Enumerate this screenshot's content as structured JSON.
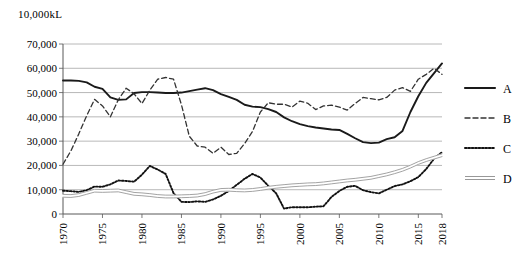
{
  "chart_data": {
    "type": "line",
    "title": "",
    "unit_label": "10,000kL",
    "xlabel": "",
    "ylabel": "",
    "xlim": [
      1970,
      2018
    ],
    "ylim": [
      0,
      70000
    ],
    "ytick_values": [
      0,
      10000,
      20000,
      30000,
      40000,
      50000,
      60000,
      70000
    ],
    "ytick_labels": [
      "0",
      "10,000",
      "20,000",
      "30,000",
      "40,000",
      "50,000",
      "60,000",
      "70,000"
    ],
    "xtick_values": [
      1970,
      1975,
      1980,
      1985,
      1990,
      1995,
      2000,
      2005,
      2010,
      2015,
      2018
    ],
    "xtick_labels": [
      "1970",
      "1975",
      "1980",
      "1985",
      "1990",
      "1995",
      "2000",
      "2005",
      "2010",
      "2015",
      "2018"
    ],
    "grid": "horizontal",
    "legend_position": "right",
    "x": [
      1970,
      1971,
      1972,
      1973,
      1974,
      1975,
      1976,
      1977,
      1978,
      1979,
      1980,
      1981,
      1982,
      1983,
      1984,
      1985,
      1986,
      1987,
      1988,
      1989,
      1990,
      1991,
      1992,
      1993,
      1994,
      1995,
      1996,
      1997,
      1998,
      1999,
      2000,
      2001,
      2002,
      2003,
      2004,
      2005,
      2006,
      2007,
      2008,
      2009,
      2010,
      2011,
      2012,
      2013,
      2014,
      2015,
      2016,
      2017,
      2018
    ],
    "series": [
      {
        "name": "A",
        "style": "solid",
        "color": "#1a1a1a",
        "values": [
          55000,
          55000,
          54800,
          54200,
          52400,
          51500,
          48000,
          47000,
          47200,
          49800,
          50200,
          50200,
          50000,
          49800,
          49800,
          50000,
          50600,
          51200,
          51800,
          51000,
          49400,
          48200,
          47000,
          45000,
          44200,
          44000,
          43200,
          42000,
          39800,
          38200,
          37000,
          36200,
          35600,
          35200,
          34800,
          34600,
          33000,
          31200,
          29600,
          29200,
          29400,
          30800,
          31600,
          34200,
          42000,
          48500,
          54000,
          58000,
          62000
        ]
      },
      {
        "name": "B",
        "style": "dashed",
        "color": "#333333",
        "values": [
          20500,
          26000,
          33000,
          40500,
          47200,
          44500,
          40000,
          47000,
          51800,
          49500,
          45500,
          51000,
          55500,
          56200,
          55500,
          45000,
          32000,
          28000,
          27500,
          25000,
          27500,
          24500,
          25000,
          29000,
          34000,
          42000,
          45800,
          45200,
          45200,
          44000,
          46500,
          45600,
          43000,
          44500,
          44800,
          44000,
          42800,
          45500,
          48000,
          47500,
          47000,
          48000,
          51000,
          52000,
          50500,
          55500,
          57500,
          60000,
          57500
        ]
      },
      {
        "name": "C",
        "style": "dotted",
        "color": "#111111",
        "values": [
          9600,
          9400,
          9100,
          9800,
          11300,
          11200,
          12200,
          13800,
          13600,
          13300,
          16200,
          19800,
          18300,
          16500,
          8600,
          5000,
          4900,
          5200,
          5000,
          6000,
          7500,
          9500,
          12000,
          14500,
          16500,
          15000,
          11600,
          8500,
          2200,
          2800,
          2800,
          2800,
          3000,
          3200,
          7000,
          9500,
          11200,
          11600,
          9800,
          9000,
          8500,
          10000,
          11500,
          12200,
          13500,
          15200,
          18500,
          22800,
          25500
        ]
      },
      {
        "name": "D",
        "style": "double-line",
        "color": "#8c8c8c",
        "values": [
          7500,
          7400,
          7800,
          8700,
          9600,
          9500,
          9600,
          9700,
          9000,
          8300,
          8100,
          7800,
          7400,
          7200,
          7200,
          7300,
          7400,
          7600,
          8200,
          9200,
          9900,
          10000,
          9800,
          9700,
          9900,
          10300,
          10800,
          11200,
          11500,
          11800,
          12000,
          12200,
          12300,
          12600,
          13000,
          13400,
          13800,
          14100,
          14500,
          14900,
          15600,
          16300,
          17200,
          18200,
          19500,
          21000,
          22200,
          23200,
          24200
        ]
      }
    ],
    "legend": [
      {
        "label": "A",
        "style": "solid"
      },
      {
        "label": "B",
        "style": "dashed"
      },
      {
        "label": "C",
        "style": "dotted"
      },
      {
        "label": "D",
        "style": "double-line"
      }
    ]
  }
}
